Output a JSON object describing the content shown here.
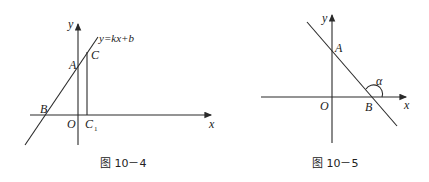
{
  "figures": [
    {
      "caption": "图 10－4",
      "labels": {
        "y_axis": "y",
        "x_axis": "x",
        "origin": "O",
        "line_equation": "y=kx+b",
        "point_a": "A",
        "point_b": "B",
        "point_c": "C",
        "point_c1": "C",
        "point_c1_sub": "1"
      }
    },
    {
      "caption": "图 10－5",
      "labels": {
        "y_axis": "y",
        "x_axis": "x",
        "origin": "O",
        "point_a": "A",
        "point_b": "B",
        "angle": "α"
      }
    }
  ],
  "colors": {
    "stroke": "#2a2a2a",
    "background": "#ffffff"
  }
}
